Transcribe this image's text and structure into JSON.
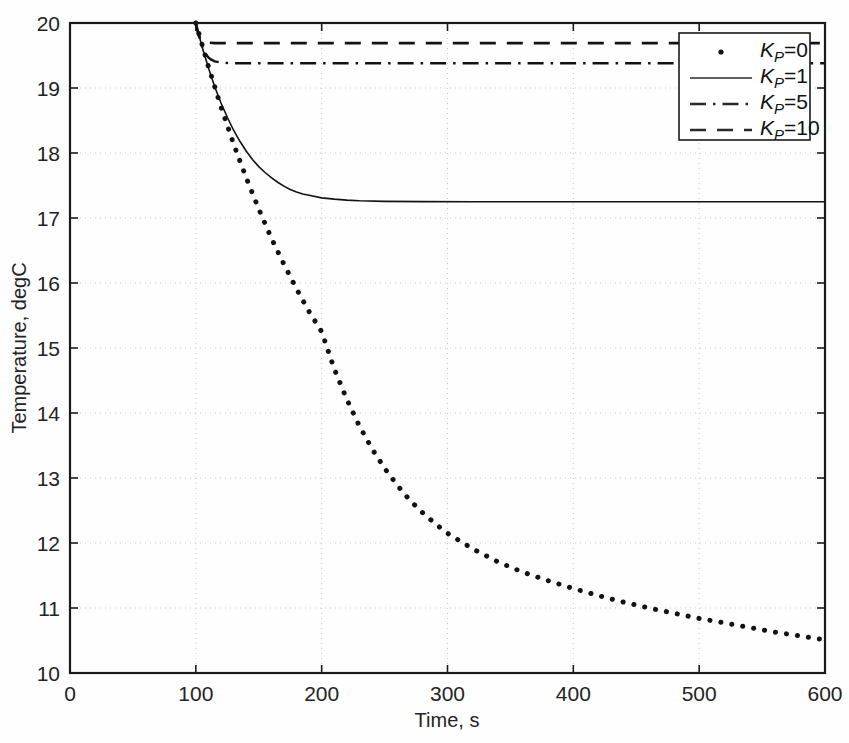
{
  "chart_data": {
    "type": "line",
    "title": "",
    "xlabel": "Time, s",
    "ylabel": "Temperature, degC",
    "xlim": [
      0,
      600
    ],
    "ylim": [
      10,
      20
    ],
    "xticks": [
      0,
      100,
      200,
      300,
      400,
      500,
      600
    ],
    "yticks": [
      10,
      11,
      12,
      13,
      14,
      15,
      16,
      17,
      18,
      19,
      20
    ],
    "grid": true,
    "legend_position": "upper right",
    "legend_entries": [
      {
        "label": "K_P=0",
        "label_prefix": "K",
        "label_sub": "P",
        "label_suffix": "=0",
        "style": "dotted-marker",
        "marker": "dot"
      },
      {
        "label": "K_P=1",
        "label_prefix": "K",
        "label_sub": "P",
        "label_suffix": "=1",
        "style": "solid",
        "marker": "none"
      },
      {
        "label": "K_P=5",
        "label_prefix": "K",
        "label_sub": "P",
        "label_suffix": "=5",
        "style": "dash-dot",
        "marker": "none"
      },
      {
        "label": "K_P=10",
        "label_prefix": "K",
        "label_sub": "P",
        "label_suffix": "=10",
        "style": "dashed",
        "marker": "none"
      }
    ],
    "series": [
      {
        "name": "K_P=0",
        "style": "dotted-marker",
        "color": "#121212",
        "linewidth": 5,
        "steady_state": 10.05,
        "x": [
          100,
          110,
          120,
          130,
          140,
          150,
          160,
          170,
          180,
          190,
          200,
          210,
          220,
          230,
          240,
          250,
          260,
          270,
          280,
          290,
          300,
          320,
          340,
          360,
          380,
          400,
          420,
          440,
          460,
          480,
          500,
          520,
          540,
          560,
          580,
          600
        ],
        "y": [
          20.0,
          19.33,
          18.71,
          18.14,
          17.62,
          17.14,
          16.69,
          16.29,
          15.91,
          15.56,
          15.25,
          14.68,
          14.21,
          13.8,
          13.45,
          13.15,
          12.89,
          12.66,
          12.47,
          12.3,
          12.15,
          11.91,
          11.71,
          11.55,
          11.42,
          11.3,
          11.19,
          11.09,
          11.0,
          10.92,
          10.84,
          10.77,
          10.7,
          10.63,
          10.57,
          10.51
        ]
      },
      {
        "name": "K_P=1",
        "style": "solid",
        "color": "#3a3a3a",
        "linewidth": 1.6,
        "steady_state": 17.25,
        "x": [
          100,
          105,
          110,
          115,
          120,
          125,
          130,
          135,
          140,
          145,
          150,
          155,
          160,
          165,
          170,
          175,
          180,
          185,
          190,
          200,
          210,
          220,
          230,
          250,
          280,
          320,
          400,
          500,
          600
        ],
        "y": [
          20.0,
          19.63,
          19.31,
          19.02,
          18.77,
          18.55,
          18.35,
          18.18,
          18.03,
          17.9,
          17.79,
          17.7,
          17.62,
          17.55,
          17.49,
          17.44,
          17.4,
          17.37,
          17.35,
          17.31,
          17.29,
          17.275,
          17.265,
          17.256,
          17.252,
          17.25,
          17.25,
          17.25,
          17.25
        ]
      },
      {
        "name": "K_P=5",
        "style": "dash-dot",
        "color": "#2a2a2a",
        "linewidth": 2.4,
        "steady_state": 19.38,
        "x": [
          100,
          102,
          104,
          106,
          108,
          110,
          112,
          115,
          120,
          130,
          150,
          200,
          300,
          400,
          500,
          600
        ],
        "y": [
          20.0,
          19.84,
          19.7,
          19.59,
          19.52,
          19.47,
          19.44,
          19.41,
          19.39,
          19.382,
          19.38,
          19.38,
          19.38,
          19.38,
          19.38,
          19.38
        ]
      },
      {
        "name": "K_P=10",
        "style": "dashed",
        "color": "#2a2a2a",
        "linewidth": 2.6,
        "steady_state": 19.69,
        "x": [
          100,
          101,
          102,
          103,
          104,
          106,
          108,
          110,
          115,
          120,
          140,
          200,
          300,
          400,
          500,
          600
        ],
        "y": [
          20.0,
          19.9,
          19.83,
          19.78,
          19.75,
          19.72,
          19.705,
          19.697,
          19.691,
          19.69,
          19.69,
          19.69,
          19.69,
          19.69,
          19.69,
          19.69
        ]
      }
    ]
  },
  "axes": {
    "x_tick_labels": [
      "0",
      "100",
      "200",
      "300",
      "400",
      "500",
      "600"
    ],
    "y_tick_labels": [
      "10",
      "11",
      "12",
      "13",
      "14",
      "15",
      "16",
      "17",
      "18",
      "19",
      "20"
    ],
    "x_axis_title": "Time, s",
    "y_axis_title": "Temperature, degC"
  },
  "colors": {
    "background": "#fefefe",
    "axis": "#1a1a1a",
    "grid": "#c9c9c9",
    "curve": "#121212"
  }
}
